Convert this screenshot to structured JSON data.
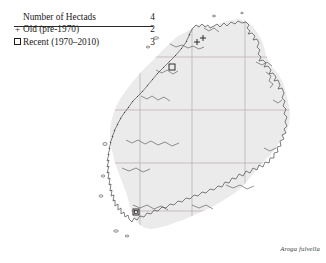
{
  "legend": {
    "header": {
      "label": "Number of Hectads",
      "count": "4"
    },
    "rows": [
      {
        "symbol": "+",
        "symbol_name": "plus-marker",
        "label": "Old  (pre-1970)",
        "count": "2"
      },
      {
        "symbol": "□",
        "symbol_name": "square-marker",
        "label": "Recent  (1970–2010)",
        "count": "3"
      }
    ]
  },
  "map": {
    "region_name": "Ireland",
    "land_fill": "#ebebeb",
    "coast_stroke": "#3c3c3c",
    "grid_stroke": "#b9a9a9",
    "markers": [
      {
        "type": "plus",
        "x": 101,
        "y": 42
      },
      {
        "type": "plus",
        "x": 104,
        "y": 40
      },
      {
        "type": "square",
        "x": 76,
        "y": 67
      },
      {
        "type": "square",
        "x": 40,
        "y": 212
      }
    ]
  },
  "species": {
    "name": "Aroga fulvella"
  }
}
